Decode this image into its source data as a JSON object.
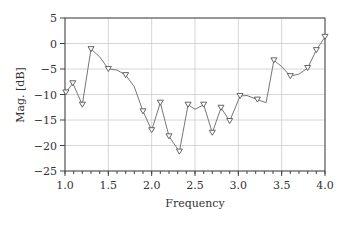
{
  "chart_data": {
    "type": "line",
    "title": "",
    "xlabel": "Frequency",
    "ylabel": "Mag. [dB]",
    "xlim": [
      1.0,
      4.0
    ],
    "ylim": [
      -25,
      5
    ],
    "grid": true,
    "legend": null,
    "xticks": [
      "1.0",
      "1.5",
      "2.0",
      "2.5",
      "3.0",
      "3.5",
      "4.0"
    ],
    "yticks": [
      "5",
      "0",
      "-5",
      "-10",
      "-15",
      "-20",
      "-25"
    ],
    "series": [
      {
        "name": "Magnitude",
        "marker": "triangle-down",
        "color": "#666666",
        "points": [
          {
            "x": 1.01,
            "y": -9.6,
            "marker": true
          },
          {
            "x": 1.09,
            "y": -7.8,
            "marker": true
          },
          {
            "x": 1.2,
            "y": -12.0,
            "marker": true
          },
          {
            "x": 1.3,
            "y": -1.1,
            "marker": true
          },
          {
            "x": 1.4,
            "y": -2.6,
            "marker": false
          },
          {
            "x": 1.5,
            "y": -5.0,
            "marker": true
          },
          {
            "x": 1.6,
            "y": -5.2,
            "marker": false
          },
          {
            "x": 1.7,
            "y": -6.2,
            "marker": true
          },
          {
            "x": 1.8,
            "y": -8.5,
            "marker": false
          },
          {
            "x": 1.9,
            "y": -13.3,
            "marker": true
          },
          {
            "x": 2.0,
            "y": -17.0,
            "marker": true
          },
          {
            "x": 2.1,
            "y": -11.6,
            "marker": true
          },
          {
            "x": 2.2,
            "y": -18.2,
            "marker": true
          },
          {
            "x": 2.32,
            "y": -21.2,
            "marker": true
          },
          {
            "x": 2.42,
            "y": -12.0,
            "marker": true
          },
          {
            "x": 2.5,
            "y": -12.9,
            "marker": false
          },
          {
            "x": 2.6,
            "y": -12.0,
            "marker": true
          },
          {
            "x": 2.7,
            "y": -17.5,
            "marker": true
          },
          {
            "x": 2.8,
            "y": -12.6,
            "marker": true
          },
          {
            "x": 2.9,
            "y": -15.2,
            "marker": true
          },
          {
            "x": 3.02,
            "y": -10.3,
            "marker": true
          },
          {
            "x": 3.1,
            "y": -10.2,
            "marker": false
          },
          {
            "x": 3.22,
            "y": -11.0,
            "marker": true
          },
          {
            "x": 3.32,
            "y": -11.6,
            "marker": false
          },
          {
            "x": 3.41,
            "y": -3.3,
            "marker": true
          },
          {
            "x": 3.5,
            "y": -4.5,
            "marker": false
          },
          {
            "x": 3.6,
            "y": -6.4,
            "marker": true
          },
          {
            "x": 3.7,
            "y": -6.0,
            "marker": false
          },
          {
            "x": 3.8,
            "y": -4.8,
            "marker": true
          },
          {
            "x": 3.9,
            "y": -1.3,
            "marker": true
          },
          {
            "x": 4.0,
            "y": 1.3,
            "marker": true
          }
        ]
      }
    ]
  }
}
